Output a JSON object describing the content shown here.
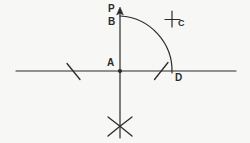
{
  "figure": {
    "background_color": "#f7f7f6",
    "ink_color": "#2b2b2b",
    "width": 250,
    "height": 143
  },
  "labels": {
    "P": "P",
    "B": "B",
    "A": "A",
    "C": "C",
    "D": "D"
  },
  "points": {
    "A": {
      "x": 120,
      "y": 71,
      "description": "origin / intersection of the horizontal line and the vertical ray"
    },
    "B": {
      "x": 120,
      "y": 16,
      "description": "point on the vertical ray where the arc begins"
    },
    "P": {
      "x": 120,
      "y": 10,
      "description": "arrow tip of the vertical ray"
    },
    "C": {
      "x": 172,
      "y": 20,
      "description": "small cross construction mark"
    },
    "D": {
      "x": 172,
      "y": 71,
      "description": "point on the horizontal line where the arc ends"
    }
  },
  "elements": {
    "horizontal_line": {
      "x1": 16,
      "y1": 71,
      "x2": 236,
      "y2": 71
    },
    "vertical_ray": {
      "x1": 120,
      "y1": 10,
      "x2": 120,
      "y2": 138
    },
    "arc_BD": {
      "center_x": 120,
      "center_y": 71,
      "radius": 55,
      "from": "B",
      "to": "D"
    },
    "arrow_head": {
      "x": 120,
      "y": 10,
      "direction": "up"
    },
    "center_dot": {
      "x": 120,
      "y": 71,
      "r": 2
    },
    "tick_left": {
      "x1": 67,
      "y1": 64,
      "x2": 80,
      "y2": 79
    },
    "tick_right": {
      "x1": 155,
      "y1": 79,
      "x2": 168,
      "y2": 63
    },
    "cross_C": {
      "x": 172,
      "y": 20,
      "size": 9
    },
    "cross_bottom": {
      "x": 120,
      "y": 127,
      "size": 11
    }
  },
  "icons": {
    "arrow_up": "arrow-up-icon",
    "cross_mark": "cross-mark-icon",
    "tick_mark": "tick-mark-icon",
    "vertex_dot": "vertex-dot-icon"
  }
}
